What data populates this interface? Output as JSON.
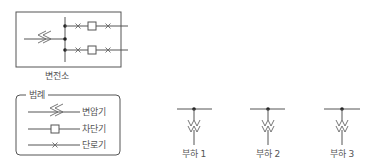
{
  "substation": {
    "label": "변전소"
  },
  "legend": {
    "title": "범례",
    "items": [
      {
        "symbol": "transformer-icon",
        "label": "변압기"
      },
      {
        "symbol": "circuit-breaker-icon",
        "label": "차단기"
      },
      {
        "symbol": "disconnector-icon",
        "label": "단로기"
      }
    ]
  },
  "loads": [
    {
      "label": "부하 1"
    },
    {
      "label": "부하 2"
    },
    {
      "label": "부하 3"
    }
  ],
  "colors": {
    "line": "#555555",
    "node": "#222222",
    "background": "#ffffff"
  }
}
